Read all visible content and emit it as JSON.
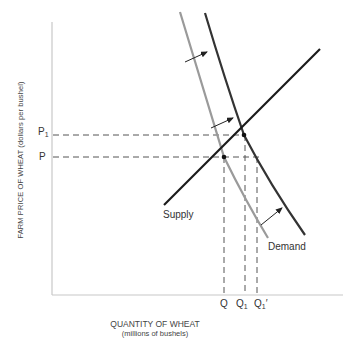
{
  "diagram": {
    "type": "supply-demand",
    "y_axis_label": "FARM PRICE OF WHEAT",
    "y_axis_units": "(dollars per bushel)",
    "x_axis_label": "QUANTITY OF WHEAT",
    "x_axis_units": "(millions of bushels)",
    "price_ticks": [
      {
        "label": "P",
        "subscript": "1"
      },
      {
        "label": "P",
        "subscript": ""
      }
    ],
    "quantity_ticks": [
      {
        "label": "Q",
        "subscript": "",
        "prime": ""
      },
      {
        "label": "Q",
        "subscript": "1",
        "prime": ""
      },
      {
        "label": "Q",
        "subscript": "1",
        "prime": "′"
      }
    ],
    "curve_labels": {
      "supply": "Supply",
      "demand": "Demand"
    },
    "colors": {
      "axis": "#c8c8c8",
      "supply": "#1a1a1a",
      "demand_new": "#333333",
      "demand_old": "#9a9a9a",
      "dashes": "#555555"
    },
    "annotations": "Arrows indicate rightward shift of demand curve from original (grey) to new (dark) position"
  }
}
